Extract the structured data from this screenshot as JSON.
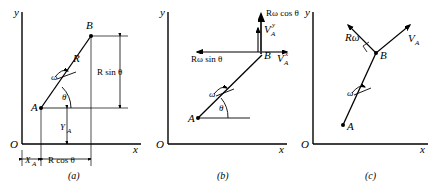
{
  "figure": {
    "panels": [
      {
        "id": "a",
        "caption": "(a)",
        "axis": {
          "y_label": "y",
          "x_label": "x",
          "origin_label": "O"
        },
        "points": [
          {
            "name": "A",
            "label": "A"
          },
          {
            "name": "B",
            "label": "B"
          }
        ],
        "annotations": [
          {
            "name": "rod-length",
            "label": "R"
          },
          {
            "name": "angular-velocity",
            "label": "ω"
          },
          {
            "name": "angle-theta",
            "label": "θ"
          },
          {
            "name": "vertical-projection",
            "label": "R sin θ"
          },
          {
            "name": "y-offset",
            "label": "Y",
            "sub": "A"
          },
          {
            "name": "x-offset",
            "label": "X",
            "sub": "A"
          },
          {
            "name": "horizontal-projection",
            "label": "R cos θ"
          }
        ]
      },
      {
        "id": "b",
        "caption": "(b)",
        "axis": {
          "y_label": "y",
          "x_label": "x",
          "origin_label": "O"
        },
        "points": [
          {
            "name": "A",
            "label": "A"
          },
          {
            "name": "B",
            "label": "B"
          }
        ],
        "annotations": [
          {
            "name": "angular-velocity",
            "label": "ω"
          },
          {
            "name": "angle-theta",
            "label": "θ"
          },
          {
            "name": "vertical-velocity-component",
            "label": "Rω cos θ"
          },
          {
            "name": "horizontal-velocity-component",
            "label": "Rω sin θ"
          },
          {
            "name": "va-y-vector",
            "label": "V",
            "sub": "A",
            "sup": "y"
          },
          {
            "name": "va-x-vector",
            "label": "V",
            "sub": "A",
            "sup": "x"
          }
        ]
      },
      {
        "id": "c",
        "caption": "(c)",
        "axis": {
          "y_label": "y",
          "x_label": "x",
          "origin_label": "O"
        },
        "points": [
          {
            "name": "A",
            "label": "A"
          },
          {
            "name": "B",
            "label": "B"
          }
        ],
        "annotations": [
          {
            "name": "relative-velocity",
            "label": "Rω"
          },
          {
            "name": "va-vector",
            "label": "V",
            "sub": "A"
          },
          {
            "name": "angular-velocity",
            "label": "ω"
          },
          {
            "name": "right-angle-mark",
            "label": ""
          }
        ]
      }
    ],
    "colors": {
      "ink": "#000000",
      "background": "#ffffff"
    }
  }
}
